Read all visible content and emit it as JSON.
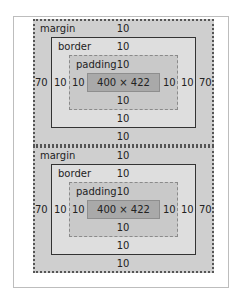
{
  "diagrams": [
    {
      "margin": {
        "label": "margin",
        "top": "10",
        "right": "70",
        "bottom": "10",
        "left": "70"
      },
      "border": {
        "label": "border",
        "top": "10",
        "right": "10",
        "bottom": "10",
        "left": "10"
      },
      "padding": {
        "label": "padding",
        "top": "10",
        "right": "10",
        "bottom": "10",
        "left": "10"
      },
      "content": {
        "size": "400 × 422"
      }
    },
    {
      "margin": {
        "label": "margin",
        "top": "10",
        "right": "70",
        "bottom": "10",
        "left": "70"
      },
      "border": {
        "label": "border",
        "top": "10",
        "right": "10",
        "bottom": "10",
        "left": "10"
      },
      "padding": {
        "label": "padding",
        "top": "10",
        "right": "10",
        "bottom": "10",
        "left": "10"
      },
      "content": {
        "size": "400 × 422"
      }
    }
  ],
  "colors": {
    "margin": "#cfcfcf",
    "border": "#dedede",
    "padding": "#c9c9c9",
    "content": "#a9a9a9"
  }
}
